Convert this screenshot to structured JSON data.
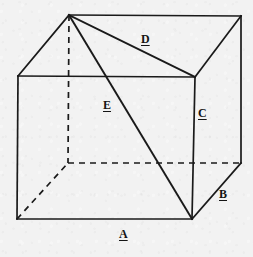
{
  "figure": {
    "name": "cube-with-labeled-edges-and-diagonals",
    "canvas": {
      "width": 253,
      "height": 257
    },
    "colors": {
      "background": "#f2f2f2",
      "ink": "#1a1a1a"
    },
    "vertices": {
      "top_back_left": {
        "x": 69,
        "y": 15
      },
      "top_back_right": {
        "x": 241,
        "y": 16
      },
      "top_front_left": {
        "x": 18,
        "y": 76
      },
      "top_front_right": {
        "x": 195,
        "y": 77
      },
      "bottom_back_left": {
        "x": 68,
        "y": 163
      },
      "bottom_back_right": {
        "x": 241,
        "y": 163
      },
      "bottom_front_left": {
        "x": 17,
        "y": 219
      },
      "bottom_front_right": {
        "x": 192,
        "y": 219
      }
    },
    "edges": [
      {
        "id": "top-front-edge",
        "style": "solid",
        "from": "top_front_left",
        "to": "top_front_right"
      },
      {
        "id": "top-back-edge",
        "style": "solid",
        "from": "top_back_left",
        "to": "top_back_right"
      },
      {
        "id": "top-left-receding-edge",
        "style": "solid",
        "from": "top_front_left",
        "to": "top_back_left"
      },
      {
        "id": "top-right-receding-edge",
        "style": "solid",
        "from": "top_front_right",
        "to": "top_back_right"
      },
      {
        "id": "front-left-vertical-edge",
        "style": "solid",
        "from": "top_front_left",
        "to": "bottom_front_left"
      },
      {
        "id": "front-right-vertical-edge",
        "style": "solid",
        "from": "top_front_right",
        "to": "bottom_front_right"
      },
      {
        "id": "back-right-vertical-edge",
        "style": "solid",
        "from": "top_back_right",
        "to": "bottom_back_right"
      },
      {
        "id": "back-left-vertical-edge",
        "style": "hidden",
        "from": "top_back_left",
        "to": "bottom_back_left"
      },
      {
        "id": "bottom-front-edge",
        "style": "solid",
        "from": "bottom_front_left",
        "to": "bottom_front_right"
      },
      {
        "id": "bottom-back-edge",
        "style": "hidden",
        "from": "bottom_back_left",
        "to": "bottom_back_right"
      },
      {
        "id": "bottom-left-receding-edge",
        "style": "hidden",
        "from": "bottom_front_left",
        "to": "bottom_back_left"
      },
      {
        "id": "bottom-right-receding-edge",
        "style": "solid",
        "from": "bottom_front_right",
        "to": "bottom_back_right"
      }
    ],
    "diagonals": [
      {
        "id": "face-diagonal-D",
        "label": "D",
        "style": "solid",
        "from": "top_back_left",
        "to": "top_front_right"
      },
      {
        "id": "space-diagonal-E",
        "label": "E",
        "style": "solid",
        "from": "top_back_left",
        "to": "bottom_front_right"
      }
    ],
    "labels": [
      {
        "id": "label-A",
        "text": "A",
        "x": 119,
        "y": 228,
        "describes": "bottom-front-edge"
      },
      {
        "id": "label-B",
        "text": "B",
        "x": 219,
        "y": 188,
        "describes": "bottom-right-receding-edge"
      },
      {
        "id": "label-C",
        "text": "C",
        "x": 198,
        "y": 107,
        "describes": "back-right-vertical-edge"
      },
      {
        "id": "label-D",
        "text": "D",
        "x": 141,
        "y": 33,
        "describes": "face-diagonal-D"
      },
      {
        "id": "label-E",
        "text": "E",
        "x": 103,
        "y": 99,
        "describes": "space-diagonal-E"
      }
    ]
  }
}
